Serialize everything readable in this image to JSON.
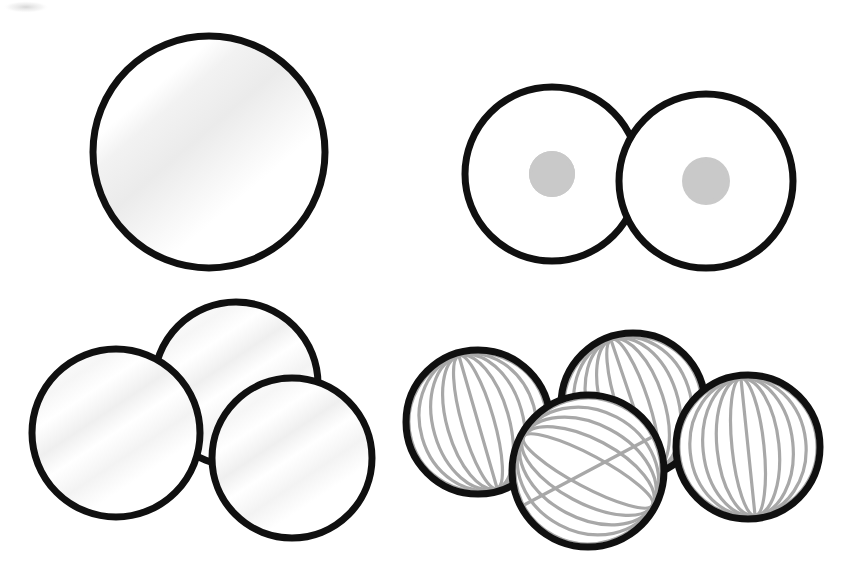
{
  "page": {
    "background_color": "#ffffff",
    "width": 848,
    "height": 582,
    "style": "black-and-white line art / coloring page"
  },
  "palette": {
    "outline": "#101010",
    "white_fill": "#ffffff",
    "shade_light": "#f4f4f4",
    "shade_soft": "#ededed",
    "dot_gray": "#c9c9c9",
    "stripe_gray": "#a8a8a8",
    "corner_smudge": "#d8d8d8"
  },
  "groups": [
    {
      "id": "group-1",
      "name": "single-plain-sphere",
      "label": "1",
      "count": 1,
      "pattern": "plain",
      "spheres": [
        {
          "name": "plain-sphere-1",
          "cx": 209,
          "cy": 152,
          "r": 116,
          "stroke_width": 7
        }
      ]
    },
    {
      "id": "group-2",
      "name": "two-polka-dot-spheres",
      "label": "2",
      "count": 2,
      "pattern": "polka-dot",
      "dot_radius": 21,
      "spheres": [
        {
          "name": "polka-sphere-1",
          "cx": 552,
          "cy": 174,
          "r": 87,
          "stroke_width": 7
        },
        {
          "name": "polka-sphere-2",
          "cx": 706,
          "cy": 181,
          "r": 87,
          "stroke_width": 7
        }
      ]
    },
    {
      "id": "group-3",
      "name": "three-plain-spheres",
      "label": "3",
      "count": 3,
      "pattern": "plain",
      "spheres": [
        {
          "name": "plain-sphere-2",
          "cx": 236,
          "cy": 384,
          "r": 82,
          "stroke_width": 7
        },
        {
          "name": "plain-sphere-3",
          "cx": 116,
          "cy": 433,
          "r": 84,
          "stroke_width": 7
        },
        {
          "name": "plain-sphere-4",
          "cx": 292,
          "cy": 458,
          "r": 80,
          "stroke_width": 7
        }
      ]
    },
    {
      "id": "group-4",
      "name": "four-striped-spheres",
      "label": "4",
      "count": 4,
      "pattern": "striped-meridians",
      "stripe_count": 11,
      "spheres": [
        {
          "name": "striped-sphere-1",
          "cx": 633,
          "cy": 405,
          "r": 72,
          "stroke_width": 7
        },
        {
          "name": "striped-sphere-2",
          "cx": 478,
          "cy": 422,
          "r": 72,
          "stroke_width": 7
        },
        {
          "name": "striped-sphere-3",
          "cx": 748,
          "cy": 447,
          "r": 72,
          "stroke_width": 7
        },
        {
          "name": "striped-sphere-4",
          "cx": 588,
          "cy": 471,
          "r": 76,
          "stroke_width": 7
        }
      ]
    }
  ],
  "decorations": [
    {
      "name": "corner-smudge-arc",
      "position": "top-left",
      "x": 4,
      "y": 2,
      "width": 46,
      "height": 14
    }
  ]
}
